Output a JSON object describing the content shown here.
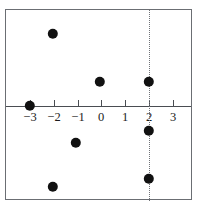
{
  "chart_data": {
    "type": "scatter",
    "title": "",
    "xlabel": "",
    "ylabel": "",
    "xlim": [
      -3.9,
      3.85
    ],
    "ylim": [
      -3.95,
      3.95
    ],
    "grid": false,
    "legend": null,
    "x_ticks": [
      -3,
      -2,
      -1,
      0,
      1,
      2,
      3
    ],
    "x_tick_labels": [
      "−3",
      "−2",
      "−1",
      "0",
      "1",
      "2",
      "3"
    ],
    "y_ticks": [],
    "y_tick_labels": [],
    "points": [
      {
        "label": "point-a",
        "x": -3,
        "y": 0,
        "px": 29,
        "py": 105
      },
      {
        "label": "point-b",
        "x": -2,
        "y": 3,
        "px": 52,
        "py": 33
      },
      {
        "label": "point-c",
        "x": -2,
        "y": -3.4,
        "px": 52,
        "py": 186
      },
      {
        "label": "point-d",
        "x": -1,
        "y": -1.55,
        "px": 75,
        "py": 142
      },
      {
        "label": "point-e",
        "x": 0,
        "y": 1,
        "px": 99,
        "py": 81
      },
      {
        "label": "point-f",
        "x": 2,
        "y": 1,
        "px": 148,
        "py": 81
      },
      {
        "label": "point-g",
        "x": 2,
        "y": -1.05,
        "px": 148,
        "py": 130
      },
      {
        "label": "point-h",
        "x": 2,
        "y": -3.05,
        "px": 148,
        "py": 178
      }
    ],
    "annotations": [
      {
        "name": "vertical-dashed-line",
        "kind": "vline",
        "x": 2,
        "style": "dotted",
        "color": "#6f7277"
      }
    ],
    "colors": {
      "point": "#111111",
      "axis": "#4a4d52",
      "frame": "#6b6e73",
      "dashed_line": "#6f7277",
      "background": "#ffffff"
    }
  },
  "geometry": {
    "frame": {
      "left": 5,
      "top": 9,
      "width": 187,
      "height": 191
    },
    "x_axis_y": 105,
    "tick_pixels": [
      29,
      53,
      77,
      100,
      124,
      148,
      172
    ],
    "tick_label_y": 110,
    "point_radius": 5.2
  }
}
